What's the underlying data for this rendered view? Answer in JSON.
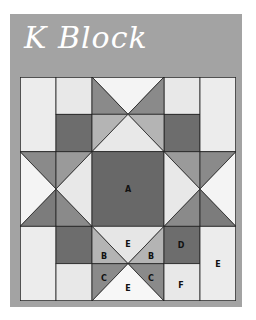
{
  "title": "K Block",
  "colors": {
    "panel": "#a3a3a3",
    "white": "#f7f7f7",
    "light": "#e6e6e6",
    "pale": "#d9d9d9",
    "mid_light": "#b4b4b4",
    "mid": "#9a9a9a",
    "mid_dark": "#8a8a8a",
    "dark": "#6d6d6d",
    "center": "#686868",
    "line": "#222222"
  },
  "grid": {
    "columns": 6,
    "rows": 6,
    "cell_width": 36,
    "cell_height": 37.33
  },
  "labels": [
    {
      "text": "A",
      "piece": "center-square",
      "x": 108,
      "y": 112
    },
    {
      "text": "E",
      "piece": "bottom-center-top-triangle",
      "x": 108,
      "y": 167
    },
    {
      "text": "B",
      "piece": "bottom-center-left-upper-triangle",
      "x": 84,
      "y": 179
    },
    {
      "text": "B",
      "piece": "bottom-center-right-upper-triangle",
      "x": 131,
      "y": 179
    },
    {
      "text": "D",
      "piece": "bottom-right-dark-square",
      "x": 161,
      "y": 168
    },
    {
      "text": "E",
      "piece": "bottom-right-tall-rectangle",
      "x": 198,
      "y": 187
    },
    {
      "text": "C",
      "piece": "bottom-center-left-lower-triangle",
      "x": 84,
      "y": 201
    },
    {
      "text": "C",
      "piece": "bottom-center-right-lower-triangle",
      "x": 131,
      "y": 201
    },
    {
      "text": "E",
      "piece": "bottom-center-bottom-triangle",
      "x": 108,
      "y": 211
    },
    {
      "text": "F",
      "piece": "bottom-right-light-square",
      "x": 161,
      "y": 208
    }
  ]
}
